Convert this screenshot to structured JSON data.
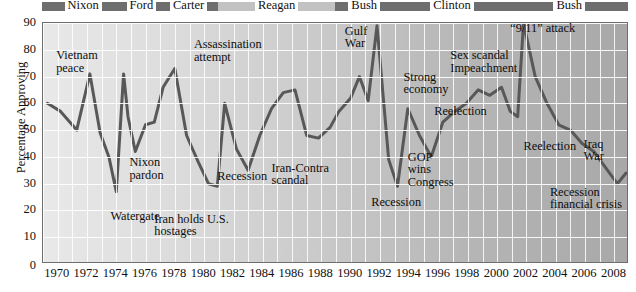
{
  "chart_data": {
    "type": "line",
    "title": "",
    "xlabel": "",
    "ylabel": "Percentage Approving",
    "xlim": [
      1969,
      2009
    ],
    "ylim": [
      0,
      90
    ],
    "yticks": [
      10,
      20,
      30,
      40,
      50,
      60,
      70,
      80,
      90
    ],
    "ytick_extra_zero": "0",
    "xticks": [
      1970,
      1972,
      1974,
      1976,
      1978,
      1980,
      1982,
      1984,
      1986,
      1988,
      1990,
      1992,
      1994,
      1996,
      1998,
      2000,
      2002,
      2004,
      2006,
      2008
    ],
    "grid": "both-axes-white-gridlines",
    "legend": "none",
    "series": [
      {
        "name": "Presidential approval",
        "x": [
          1969.3,
          1970.2,
          1971.3,
          1972.2,
          1972.9,
          1973.5,
          1974.0,
          1974.5,
          1974.8,
          1975.3,
          1976.0,
          1976.6,
          1977.2,
          1978.0,
          1978.8,
          1979.6,
          1980.3,
          1980.9,
          1981.4,
          1982.2,
          1983.0,
          1983.8,
          1984.6,
          1985.4,
          1986.2,
          1987.0,
          1987.8,
          1988.6,
          1989.2,
          1990.0,
          1990.6,
          1991.2,
          1991.8,
          1992.6,
          1993.2,
          1993.9,
          1994.7,
          1995.5,
          1996.3,
          1997.1,
          1997.9,
          1998.7,
          1999.5,
          2000.3,
          2000.9,
          2001.4,
          2001.8,
          2002.6,
          2003.4,
          2004.2,
          2005.0,
          2005.8,
          2006.6,
          2007.4,
          2008.2,
          2008.8
        ],
        "values": [
          60,
          57,
          50,
          71,
          49,
          40,
          27,
          71,
          55,
          42,
          52,
          53,
          66,
          73,
          48,
          38,
          30,
          29,
          60,
          43,
          35,
          48,
          58,
          64,
          65,
          48,
          47,
          51,
          57,
          62,
          70,
          61,
          89,
          39,
          29,
          58,
          48,
          40,
          53,
          57,
          60,
          65,
          63,
          66,
          57,
          55,
          90,
          70,
          60,
          52,
          50,
          45,
          42,
          36,
          30,
          34
        ],
        "color": "#585858",
        "linewidth": 3
      }
    ],
    "annotations": [
      {
        "text": "Vietnam\npeace",
        "x": 1969.9,
        "y": 78
      },
      {
        "text": "Watergate",
        "x": 1973.6,
        "y": 18
      },
      {
        "text": "Nixon\npardon",
        "x": 1974.9,
        "y": 38
      },
      {
        "text": "Iran holds U.S.\nhostages",
        "x": 1976.6,
        "y": 17
      },
      {
        "text": "Assassination\nattempt",
        "x": 1979.3,
        "y": 82
      },
      {
        "text": "Recession",
        "x": 1980.9,
        "y": 33
      },
      {
        "text": "Iran-Contra\nscandal",
        "x": 1984.6,
        "y": 36
      },
      {
        "text": "Gulf\nWar",
        "x": 1989.6,
        "y": 87
      },
      {
        "text": "Recession",
        "x": 1991.4,
        "y": 23
      },
      {
        "text": "Strong\neconomy",
        "x": 1993.6,
        "y": 70
      },
      {
        "text": "GOP\nwins\nCongress",
        "x": 1993.9,
        "y": 40
      },
      {
        "text": "Reelection",
        "x": 1995.7,
        "y": 57
      },
      {
        "text": "Sex scandal\nImpeachment",
        "x": 1996.8,
        "y": 78
      },
      {
        "text": "“9/11” attack",
        "x": 2000.9,
        "y": 88
      },
      {
        "text": "Reelection",
        "x": 2001.8,
        "y": 44
      },
      {
        "text": "Recession\nfinancial crisis",
        "x": 2003.6,
        "y": 27
      },
      {
        "text": "Iraq\nWar",
        "x": 2005.9,
        "y": 45
      }
    ]
  },
  "president_bar": {
    "bar_dark_color": "#6e6e6e",
    "bar_light_color": "#c2c2c2",
    "terms": [
      {
        "label": "Nixon",
        "start": 1969.0,
        "end": 1974.6,
        "shade": "dark"
      },
      {
        "label": "Ford",
        "start": 1974.6,
        "end": 1977.0,
        "shade": "dark"
      },
      {
        "label": "Carter",
        "start": 1977.0,
        "end": 1981.0,
        "shade": "dark"
      },
      {
        "label": "Reagan",
        "start": 1981.0,
        "end": 1989.0,
        "shade": "light"
      },
      {
        "label": "Bush",
        "start": 1989.0,
        "end": 1993.0,
        "shade": "dark"
      },
      {
        "label": "Clinton",
        "start": 1993.0,
        "end": 2001.0,
        "shade": "dark"
      },
      {
        "label": "Bush",
        "start": 2001.0,
        "end": 2009.0,
        "shade": "dark"
      }
    ]
  }
}
